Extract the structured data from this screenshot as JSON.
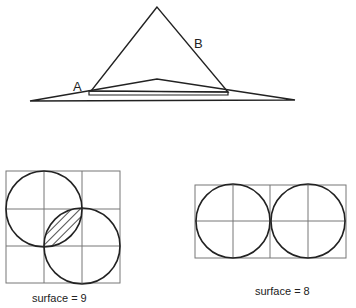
{
  "figure_top": {
    "labels": {
      "a": "A",
      "b": "B"
    },
    "description": "Large triangle B overlapping flat triangle A"
  },
  "figure_bottom_left": {
    "grid": {
      "cols": 3,
      "rows": 3
    },
    "caption": "surface = 9"
  },
  "figure_bottom_right": {
    "grid": {
      "cols": 4,
      "rows": 2
    },
    "caption": "surface = 8"
  },
  "colors": {
    "stroke": "#222222",
    "grid": "#777777",
    "background": "#ffffff"
  }
}
